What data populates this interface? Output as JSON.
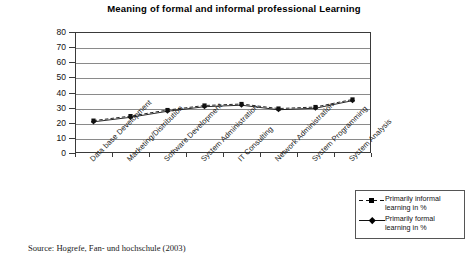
{
  "chart_data": {
    "type": "line",
    "title": "Meaning of formal and informal professional Learning",
    "xlabel": "",
    "ylabel": "",
    "ylim": [
      0,
      80
    ],
    "yticks": [
      80,
      70,
      60,
      50,
      40,
      30,
      20,
      10,
      0
    ],
    "grid": true,
    "legend_position": "bottom-right",
    "categories": [
      "Data base Development",
      "Marketing/Distribution",
      "Software Development",
      "System Administration",
      "IT Consulting",
      "Network Administration",
      "System Programming",
      "System Analysis"
    ],
    "series": [
      {
        "name": "Primarily informal learning in %",
        "values": [
          21,
          24,
          28,
          31,
          32,
          29,
          30,
          35
        ],
        "line_style": "dashed",
        "marker": "square",
        "color": "#111111"
      },
      {
        "name": "Primarily formal learning in %",
        "values": [
          21,
          24,
          28,
          31,
          32,
          29,
          30,
          35
        ],
        "line_style": "solid",
        "marker": "diamond",
        "color": "#111111"
      }
    ]
  },
  "legend": {
    "entries": [
      {
        "label_line1": "Primarily informal",
        "label_line2": "learning in %"
      },
      {
        "label_line1": "Primarily formal",
        "label_line2": "learning in %"
      }
    ]
  },
  "caption": {
    "text": "Source: Hogrefe, Fan- und hochschule (2003)"
  },
  "colors": {
    "axis": "#3a3a3a",
    "grid": "#8a8a8a",
    "series": "#111111",
    "background": "#ffffff"
  }
}
